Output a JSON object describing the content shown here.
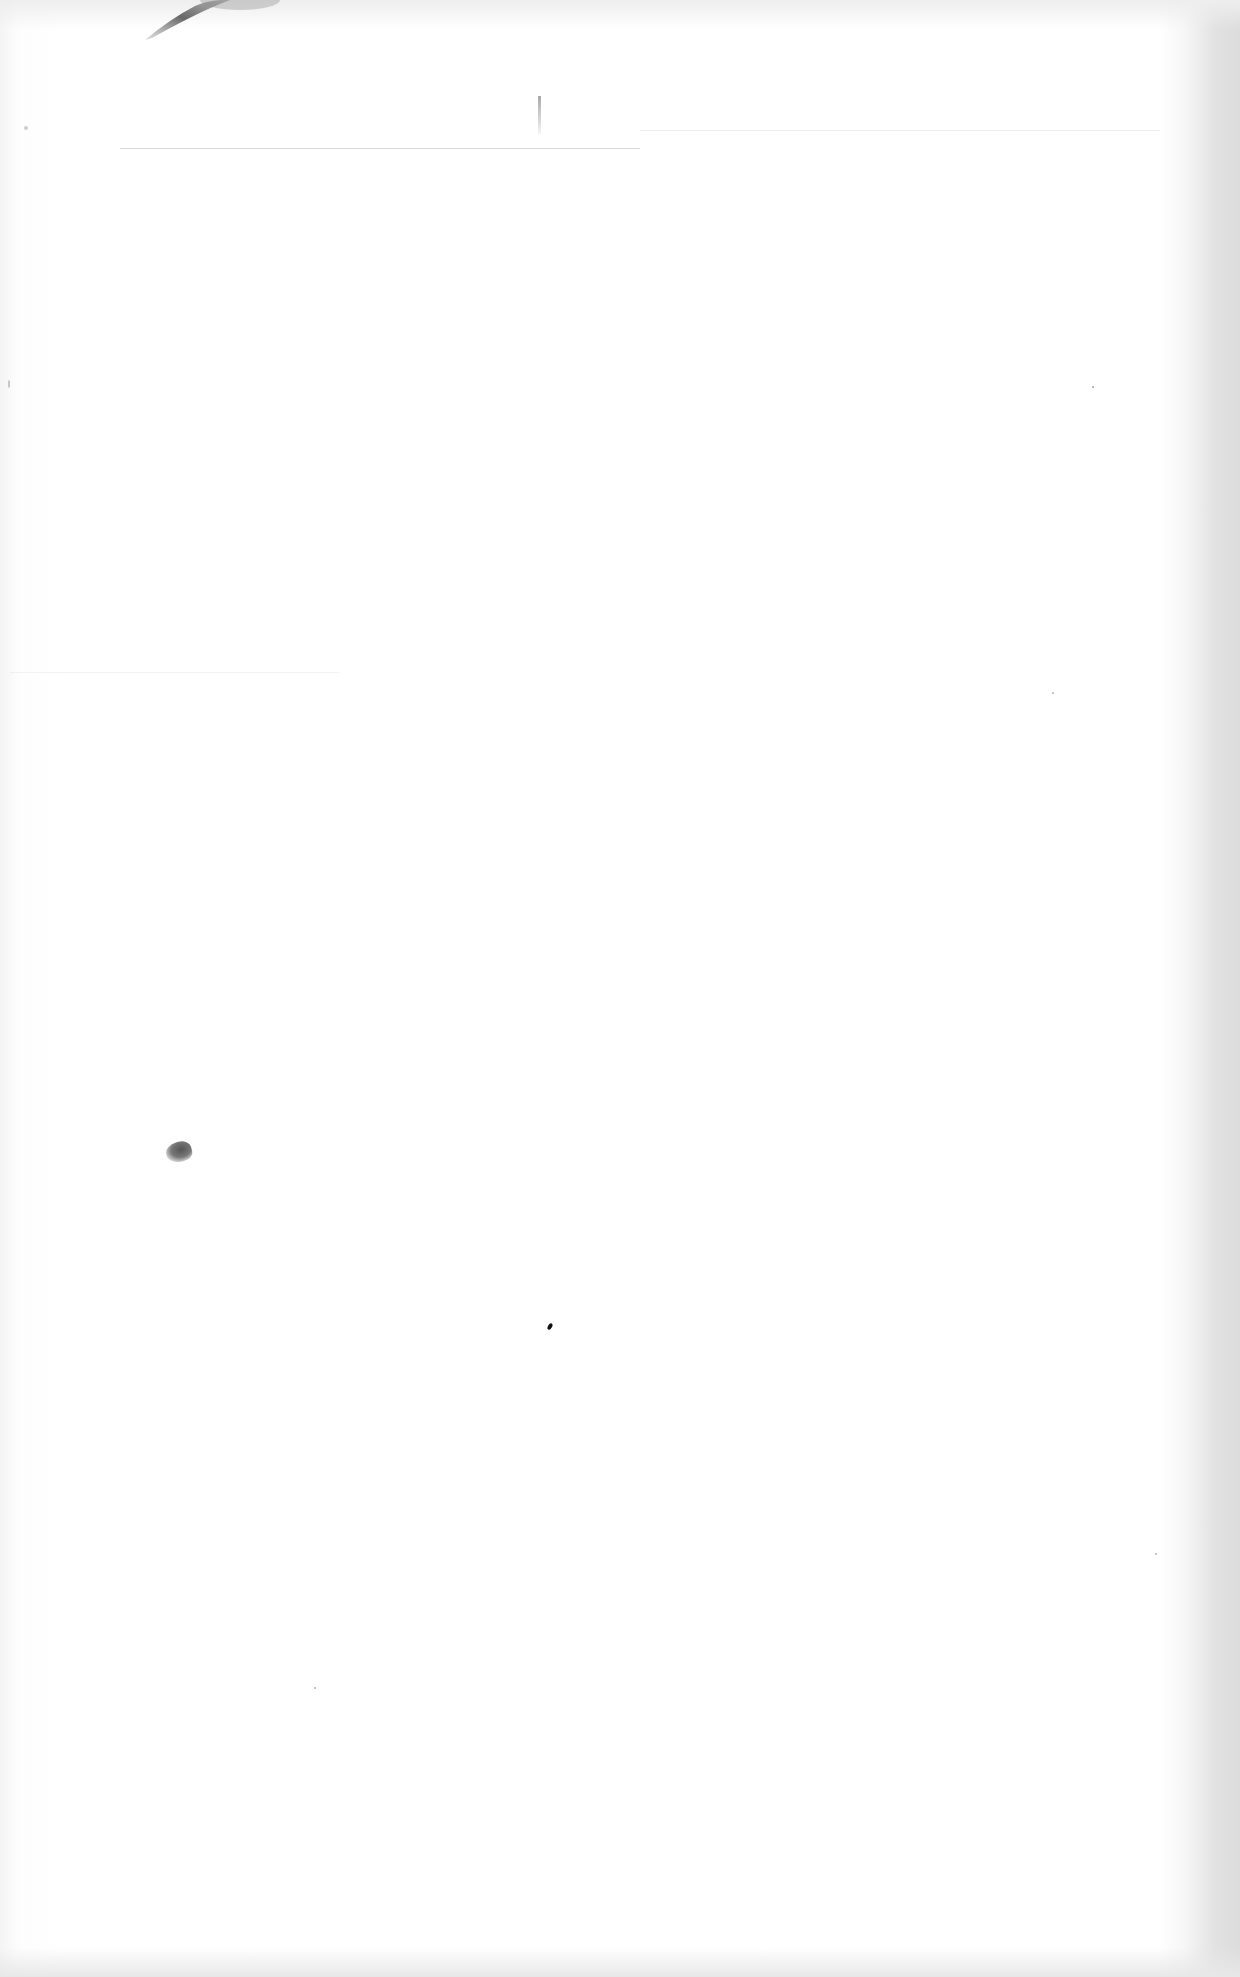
{
  "document": {
    "type": "scanned-blank-page",
    "text": "",
    "colors": {
      "paper": "#ffffff",
      "edge_shadow": "#dcdcdc",
      "artifact": "#555555"
    },
    "artifacts": [
      {
        "name": "ink-smudge",
        "x": 140,
        "y": 0
      },
      {
        "name": "faint-rule-line",
        "y": 118
      },
      {
        "name": "fold-mark",
        "x": 538,
        "y": 96
      },
      {
        "name": "blot",
        "x": 166,
        "y": 1142
      },
      {
        "name": "dot",
        "x": 548,
        "y": 1323
      }
    ]
  }
}
